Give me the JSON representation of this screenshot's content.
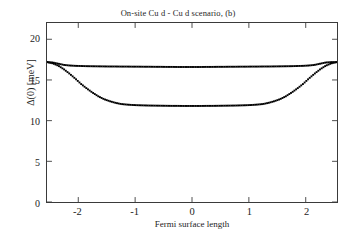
{
  "chart_data": {
    "type": "scatter",
    "title": "On-site Cu d - Cu d scenario, (b)",
    "xlabel": "Fermi surface length",
    "ylabel": "Δ(0) [meV]",
    "xlim": [
      -2.55,
      2.55
    ],
    "ylim": [
      0,
      22
    ],
    "xticks": [
      -2,
      -1,
      0,
      1,
      2
    ],
    "xticklabels": [
      "-2",
      "-1",
      "0",
      "1",
      "2"
    ],
    "yticks": [
      0,
      5,
      10,
      15,
      20
    ],
    "yticklabels": [
      "0",
      "5",
      "10",
      "15",
      "20"
    ],
    "grid": false,
    "legend": null,
    "marker": "square-dot",
    "marker_color": "#000000",
    "series": [
      {
        "name": "upper gap branch",
        "edge_value": 17.2,
        "plateau_value": 16.65,
        "x": [
          -2.55,
          -2.45,
          -2.35,
          -2.25,
          -2.15,
          -2.05,
          -1.95,
          -1.85,
          -1.75,
          -1.65,
          -1.55,
          -1.45,
          -1.35,
          -1.25,
          -1.15,
          -1.05,
          -0.95,
          -0.85,
          -0.75,
          -0.65,
          -0.55,
          -0.45,
          -0.35,
          -0.25,
          -0.15,
          -0.05,
          0.05,
          0.15,
          0.25,
          0.35,
          0.45,
          0.55,
          0.65,
          0.75,
          0.85,
          0.95,
          1.05,
          1.15,
          1.25,
          1.35,
          1.45,
          1.55,
          1.65,
          1.75,
          1.85,
          1.95,
          2.05,
          2.15,
          2.25,
          2.35,
          2.45,
          2.55
        ],
        "values": [
          17.2,
          17.15,
          17.0,
          16.85,
          16.78,
          16.74,
          16.72,
          16.7,
          16.69,
          16.68,
          16.67,
          16.66,
          16.66,
          16.65,
          16.65,
          16.64,
          16.64,
          16.63,
          16.63,
          16.62,
          16.62,
          16.61,
          16.61,
          16.6,
          16.6,
          16.6,
          16.6,
          16.6,
          16.61,
          16.61,
          16.62,
          16.62,
          16.63,
          16.63,
          16.64,
          16.64,
          16.65,
          16.65,
          16.66,
          16.66,
          16.67,
          16.68,
          16.69,
          16.7,
          16.72,
          16.74,
          16.78,
          16.85,
          17.0,
          17.15,
          17.2,
          17.2
        ]
      },
      {
        "name": "lower gap branch",
        "edge_value": 17.2,
        "plateau_value": 11.8,
        "x": [
          -2.55,
          -2.45,
          -2.35,
          -2.25,
          -2.15,
          -2.05,
          -1.95,
          -1.85,
          -1.75,
          -1.65,
          -1.55,
          -1.45,
          -1.35,
          -1.25,
          -1.15,
          -1.05,
          -0.95,
          -0.85,
          -0.75,
          -0.65,
          -0.55,
          -0.45,
          -0.35,
          -0.25,
          -0.15,
          -0.05,
          0.05,
          0.15,
          0.25,
          0.35,
          0.45,
          0.55,
          0.65,
          0.75,
          0.85,
          0.95,
          1.05,
          1.15,
          1.25,
          1.35,
          1.45,
          1.55,
          1.65,
          1.75,
          1.85,
          1.95,
          2.05,
          2.15,
          2.25,
          2.35,
          2.45,
          2.55
        ],
        "values": [
          17.2,
          17.05,
          16.75,
          16.3,
          15.75,
          15.15,
          14.5,
          13.95,
          13.45,
          13.0,
          12.65,
          12.4,
          12.2,
          12.05,
          11.98,
          11.93,
          11.9,
          11.88,
          11.86,
          11.85,
          11.84,
          11.83,
          11.82,
          11.82,
          11.81,
          11.81,
          11.81,
          11.81,
          11.82,
          11.82,
          11.83,
          11.84,
          11.85,
          11.86,
          11.88,
          11.9,
          11.93,
          11.98,
          12.05,
          12.2,
          12.4,
          12.65,
          13.0,
          13.45,
          13.95,
          14.5,
          15.15,
          15.75,
          16.3,
          16.75,
          17.05,
          17.2
        ]
      }
    ]
  }
}
